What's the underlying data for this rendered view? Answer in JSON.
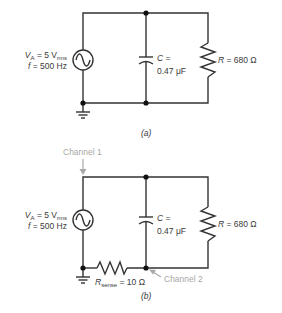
{
  "circuit_a": {
    "caption": "(a)",
    "source": {
      "v_symbol": "V",
      "v_sub": "A",
      "v_value": " = 5 V",
      "v_unit_sub": "rms",
      "f_symbol": "f",
      "f_value": " = 500 Hz"
    },
    "capacitor": {
      "line1": "C =",
      "line2": "0.47 μF"
    },
    "resistor": {
      "symbol": "R",
      "value": " = 680 Ω"
    }
  },
  "circuit_b": {
    "caption": "(b)",
    "channel1_label": "Channel 1",
    "channel2_label": "Channel 2",
    "source": {
      "v_symbol": "V",
      "v_sub": "A",
      "v_value": " = 5 V",
      "v_unit_sub": "rms",
      "f_symbol": "f",
      "f_value": " = 500 Hz"
    },
    "capacitor": {
      "line1": "C =",
      "line2": "0.47 μF"
    },
    "resistor": {
      "symbol": "R",
      "value": " = 680 Ω"
    },
    "sense_resistor": {
      "symbol": "R",
      "sub": "sense",
      "value": " = 10 Ω"
    }
  },
  "colors": {
    "wire": "#333333",
    "annotation": "#a8a8a8"
  }
}
